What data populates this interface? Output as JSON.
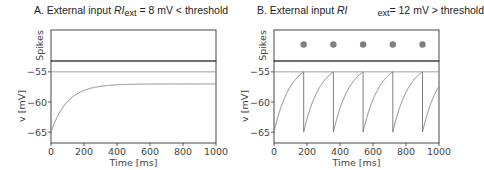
{
  "chart_data": [
    {
      "type": "line",
      "panel": "A",
      "title": "A. External input RI_ext = 8 mV < threshold",
      "title_parts": {
        "prefix": "A. External input ",
        "var": "RI",
        "sub": "ext",
        "suffix": " = 8 mV < threshold"
      },
      "subplots": [
        {
          "name": "Spikes",
          "ylabel": "Spikes",
          "spike_times_ms": []
        },
        {
          "name": "Membrane potential",
          "ylabel": "v [mV]",
          "xlabel": "Time [ms]",
          "xlim": [
            0,
            1000
          ],
          "ylim": [
            -66.8,
            -53.2
          ],
          "xticks": [
            0,
            200,
            400,
            600,
            800,
            1000
          ],
          "yticks": [
            -55,
            -60,
            -65
          ],
          "threshold_mV": -55,
          "model": {
            "v_rest": -65,
            "RI_ext": 8,
            "tau_ms": 100,
            "v_reset": -65
          },
          "series": [
            {
              "name": "v",
              "x": [
                0,
                50,
                100,
                200,
                300,
                400,
                600,
                800,
                1000
              ],
              "values": [
                -65,
                -61.9,
                -59.9,
                -58.1,
                -57.4,
                -57.15,
                -57.02,
                -57.0,
                -57.0
              ]
            }
          ]
        }
      ]
    },
    {
      "type": "line",
      "panel": "B",
      "title": "B. External input RI ext= 12 mV > threshold",
      "title_parts": {
        "prefix": "B. External input ",
        "var": "RI",
        "gap": "      ",
        "sub": "ext",
        "suffix": "= 12 mV > threshold"
      },
      "subplots": [
        {
          "name": "Spikes",
          "ylabel": "Spikes",
          "spike_times_ms": [
            180,
            360,
            540,
            720,
            900
          ]
        },
        {
          "name": "Membrane potential",
          "ylabel": "v [mV]",
          "xlabel": "Time [ms]",
          "xlim": [
            0,
            1000
          ],
          "ylim": [
            -66.8,
            -53.2
          ],
          "xticks": [
            0,
            200,
            400,
            600,
            800,
            1000
          ],
          "yticks": [
            -55,
            -60,
            -65
          ],
          "threshold_mV": -55,
          "model": {
            "v_rest": -65,
            "RI_ext": 12,
            "tau_ms": 100,
            "v_reset": -65
          },
          "series": [
            {
              "name": "v",
              "x": [
                0,
                90,
                180,
                180,
                270,
                360,
                360,
                450,
                540,
                540,
                630,
                720,
                720,
                810,
                900,
                900,
                1000
              ],
              "values": [
                -65,
                -57.9,
                -55,
                -65,
                -57.9,
                -55,
                -65,
                -57.9,
                -55,
                -65,
                -57.9,
                -55,
                -65,
                -57.9,
                -55,
                -65,
                -57.4
              ]
            }
          ]
        }
      ]
    }
  ],
  "colors": {
    "axis": "#333333",
    "trace": "#808080",
    "threshold": "#999999",
    "spike": "#808080",
    "text": "#444444"
  },
  "layout": {
    "panels": [
      {
        "x0": 51,
        "x1": 216,
        "spike_top": 30,
        "spike_bottom": 61,
        "v_top": 61,
        "v_bottom": 143,
        "title_left": 34
      },
      {
        "x0": 274,
        "x1": 439,
        "spike_top": 30,
        "spike_bottom": 61,
        "v_top": 61,
        "v_bottom": 143,
        "title_left": 257
      }
    ]
  }
}
